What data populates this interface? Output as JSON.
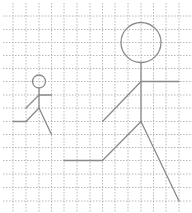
{
  "canvas": {
    "width": 192,
    "height": 213,
    "background": "#ffffff"
  },
  "colors": {
    "grid": "#b8b8b8",
    "figure": "#8a8a8a"
  },
  "grid": {
    "vertical_x": [
      13,
      26,
      39,
      51.5,
      64,
      77,
      90,
      102.5,
      115,
      128,
      141,
      153.5,
      166,
      179
    ],
    "horizontal_y": [
      16,
      29.5,
      42.5,
      55.5,
      68.5,
      81.5,
      95,
      108,
      121.5,
      134.5,
      147.5,
      160.5,
      174,
      187.5,
      201
    ],
    "x_start": 3,
    "x_end": 192,
    "y_start": 3,
    "y_end": 213
  },
  "figures": [
    {
      "name": "small-stick-figure",
      "head": {
        "cx": 39,
        "cy": 81.5,
        "r": 6.5
      },
      "segments": [
        [
          39,
          88,
          39,
          108
        ],
        [
          39,
          95,
          51.5,
          95
        ],
        [
          39,
          95,
          26,
          108
        ],
        [
          39,
          108,
          26,
          121.5
        ],
        [
          26,
          121.5,
          13,
          121.5
        ],
        [
          39,
          108,
          51.5,
          134.5
        ]
      ]
    },
    {
      "name": "large-stick-figure",
      "head": {
        "cx": 141,
        "cy": 42.5,
        "r": 20
      },
      "segments": [
        [
          141,
          62.5,
          141,
          121.5
        ],
        [
          141,
          81.5,
          179,
          81.5
        ],
        [
          141,
          81.5,
          102.5,
          121.5
        ],
        [
          141,
          121.5,
          102.5,
          160.5
        ],
        [
          102.5,
          160.5,
          64,
          160.5
        ],
        [
          141,
          121.5,
          179,
          201
        ]
      ]
    }
  ]
}
